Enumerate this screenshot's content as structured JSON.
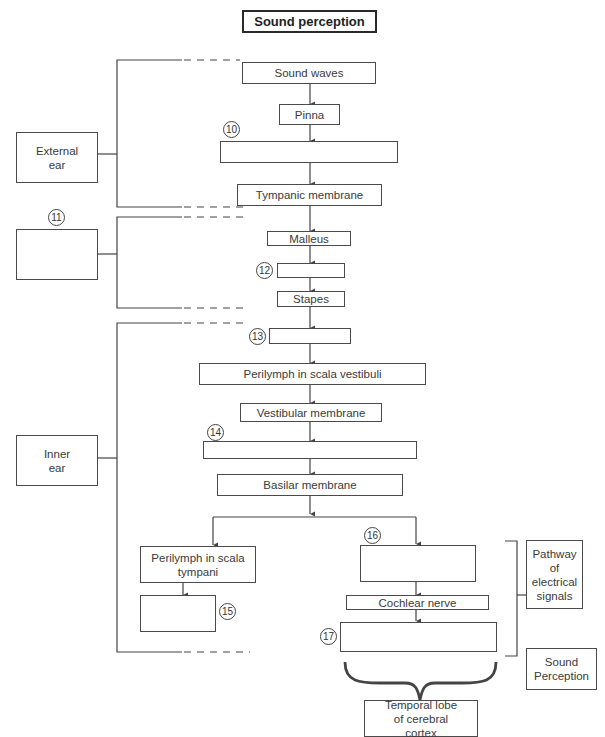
{
  "title": "Sound perception",
  "main_flow": {
    "sound_waves": "Sound waves",
    "pinna": "Pinna",
    "blank_10": "",
    "tympanic_membrane": "Tympanic membrane",
    "malleus": "Malleus",
    "blank_12": "",
    "stapes": "Stapes",
    "blank_13": "",
    "perilymph_vestibuli": "Perilymph in scala vestibuli",
    "vestibular_membrane": "Vestibular membrane",
    "blank_14": "",
    "basilar_membrane": "Basilar membrane",
    "perilymph_tympani": "Perilymph in scala tympani",
    "blank_15": "",
    "blank_16": "",
    "cochlear_nerve": "Cochlear nerve",
    "blank_17": "",
    "temporal_lobe": "Temporal lobe of cerebral cortex"
  },
  "regions": {
    "external_ear": "External ear",
    "blank_11": "",
    "inner_ear": "Inner ear"
  },
  "side_labels": {
    "pathway": "Pathway of electrical signals",
    "sound_perception": "Sound Perception"
  },
  "numbers": {
    "n10": "10",
    "n11": "11",
    "n12": "12",
    "n13": "13",
    "n14": "14",
    "n15": "15",
    "n16": "16",
    "n17": "17"
  }
}
